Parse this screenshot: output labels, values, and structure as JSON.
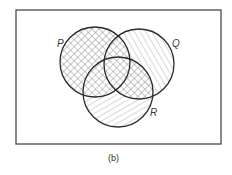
{
  "figure": {
    "caption": "(b)",
    "universe": {
      "x": 16,
      "y": 10,
      "width": 205,
      "height": 134,
      "stroke": "#4a4a4a"
    },
    "sets": [
      {
        "name": "P",
        "label": "P",
        "cx": 95,
        "cy": 62,
        "r": 35,
        "label_x": 57,
        "label_y": 47
      },
      {
        "name": "Q",
        "label": "Q",
        "cx": 139,
        "cy": 64,
        "r": 35,
        "label_x": 172,
        "label_y": 47
      },
      {
        "name": "R",
        "label": "R",
        "cx": 118,
        "cy": 92,
        "r": 35,
        "label_x": 150,
        "label_y": 116
      }
    ],
    "shading": {
      "crosshatch": "P ∪ (Q ∩ R)",
      "backslash_hatch": "Q only",
      "slash_hatch": "R only"
    },
    "line_color": "#2b2b2b",
    "hatch_color": "#6a6a6a"
  }
}
